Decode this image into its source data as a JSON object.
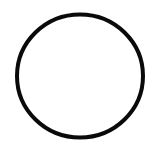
{
  "canvas": {
    "width": 156,
    "height": 147,
    "background": "#ffffff"
  },
  "shape": {
    "type": "circle-outline",
    "cx": 80,
    "cy": 76,
    "rx": 63,
    "ry": 61.5,
    "stroke": "#0a0a0a",
    "stroke_width": 4,
    "fill": "none"
  }
}
